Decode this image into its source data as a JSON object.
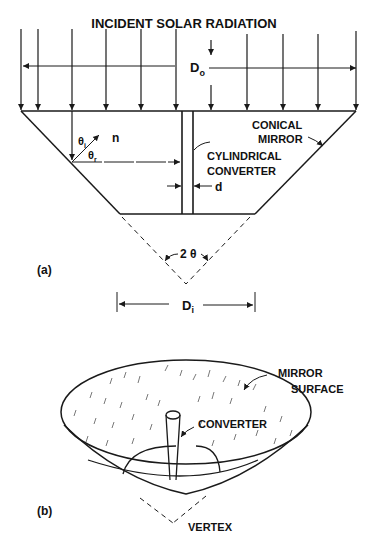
{
  "figure_a": {
    "panel_label": "(a)",
    "title": "INCIDENT SOLAR RADIATION",
    "outer_diameter": {
      "base": "D",
      "sub": "o"
    },
    "inner_diameter": {
      "base": "D",
      "sub": "i"
    },
    "mirror_label_line1": "CONICAL",
    "mirror_label_line2": "MIRROR",
    "converter_label_line1": "CYLINDRICAL",
    "converter_label_line2": "CONVERTER",
    "converter_width": "d",
    "normal": "n",
    "incidence_angle": {
      "base": "θ",
      "sub": "i"
    },
    "reflection_angle": {
      "base": "θ",
      "sub": "r"
    },
    "cone_angle": "2 θ"
  },
  "figure_b": {
    "panel_label": "(b)",
    "mirror_label_line1": "MIRROR",
    "mirror_label_line2": "SURFACE",
    "converter_label": "CONVERTER",
    "vertex_label": "VERTEX"
  },
  "colors": {
    "ink": "#1a1a1a",
    "background": "#ffffff"
  }
}
